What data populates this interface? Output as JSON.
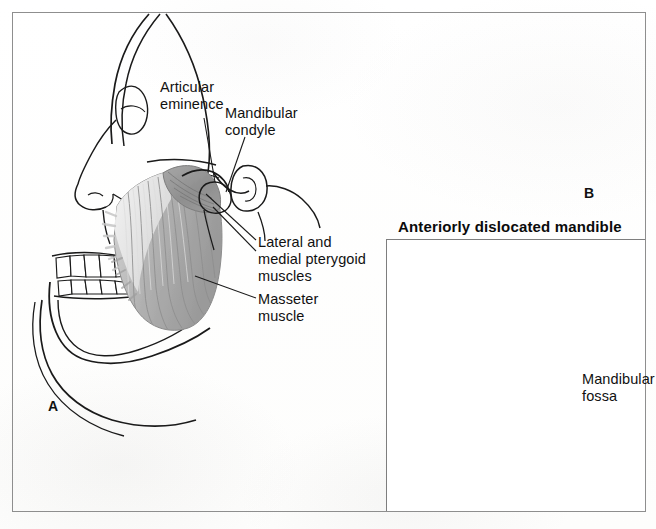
{
  "figure": {
    "title_panel_b": "Anteriorly dislocated mandible",
    "panels": [
      {
        "letter": "A",
        "name": "normal-temporomandibular-joint"
      },
      {
        "letter": "B",
        "name": "anteriorly-dislocated-mandible"
      }
    ],
    "labels": [
      {
        "id": "articular-eminence",
        "text": "Articular\neminence"
      },
      {
        "id": "mandibular-condyle",
        "text": "Mandibular\ncondyle"
      },
      {
        "id": "pterygoid-muscles",
        "text": "Lateral and\nmedial pterygoid\nmuscles"
      },
      {
        "id": "masseter-muscle",
        "text": "Masseter\nmuscle"
      },
      {
        "id": "mandibular-fossa",
        "text": "Mandibular\nfossa"
      }
    ],
    "colors": {
      "outline": "#1a1a1a",
      "frame": "#8e8e8e",
      "muscle_dark": "#9b9b9b",
      "muscle_mid": "#b3b3b3",
      "muscle_light": "#e6e6e6",
      "shade_gray": "#a8a8a8",
      "background": "#ffffff"
    }
  }
}
